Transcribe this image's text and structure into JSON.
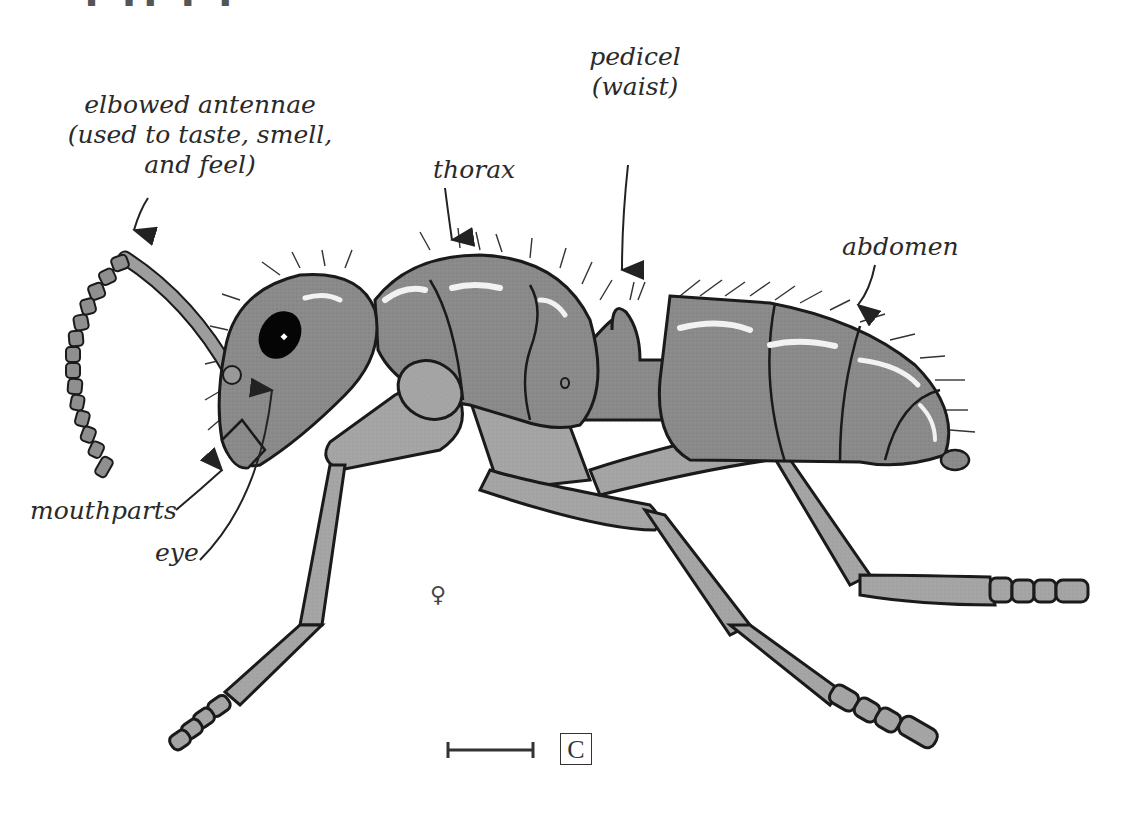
{
  "figure": {
    "sex_symbol": "♀",
    "scale_label": "C",
    "top_fragment": "▀ ▀▀ ▀ ▀",
    "colors": {
      "body_fill": "#8c8c8c",
      "body_dark": "#6e6e6e",
      "leg_fill": "#a3a3a3",
      "outline": "#1a1a1a",
      "highlight": "#f2f2f2",
      "eye": "#050505",
      "text": "#2a2a2a",
      "background": "#ffffff"
    }
  },
  "labels": {
    "antennae": {
      "line1": "elbowed antennae",
      "line2": "(used to taste, smell,",
      "line3": "and feel)"
    },
    "thorax": "thorax",
    "pedicel": {
      "line1": "pedicel",
      "line2": "(waist)"
    },
    "abdomen": "abdomen",
    "mouthparts": "mouthparts",
    "eye": "eye"
  },
  "body_parts": [
    "head",
    "eye",
    "antenna",
    "mouthparts",
    "thorax",
    "pedicel",
    "abdomen",
    "front leg",
    "middle leg",
    "hind leg"
  ]
}
